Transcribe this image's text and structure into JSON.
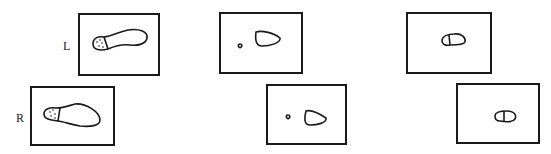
{
  "figure": {
    "row_labels": {
      "left": "L",
      "right": "R"
    },
    "panels": [
      {
        "row": "L",
        "stage": 1,
        "content": "full foot outline with dotted forefoot/toe region"
      },
      {
        "row": "L",
        "stage": 2,
        "content": "small toe contact and heel contact outlines"
      },
      {
        "row": "L",
        "stage": 3,
        "content": "small divided contact outline"
      },
      {
        "row": "R",
        "stage": 1,
        "content": "full foot outline with dotted forefoot/toe region"
      },
      {
        "row": "R",
        "stage": 2,
        "content": "small toe contact and heel contact outlines"
      },
      {
        "row": "R",
        "stage": 3,
        "content": "small divided contact outline"
      }
    ]
  }
}
